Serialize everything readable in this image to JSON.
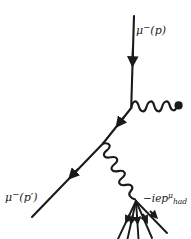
{
  "figure": {
    "type": "feynman-diagram",
    "background_color": "#ffffff",
    "line_color": "#1a1a1a",
    "width": 191,
    "height": 239
  },
  "labels": {
    "incoming_muon": {
      "text": "μ−(p)",
      "mu": "μ",
      "charge": "−",
      "momentum": "(p)"
    },
    "outgoing_muon": {
      "text": "μ−(p′)",
      "mu": "μ",
      "charge": "−",
      "momentum": "(p′)"
    },
    "hadron_current": {
      "text": "−iepμ_had",
      "prefix": "−iep",
      "superscript": "μ",
      "subscript": "had"
    }
  },
  "elements": {
    "incoming_fermion_line": {
      "name": "incoming-muon-line",
      "x1": 134,
      "y1": 18,
      "x2": 131,
      "y2": 108,
      "arrow_at": 0.48,
      "arrow_direction": "down"
    },
    "internal_fermion_line": {
      "name": "internal-muon-line",
      "x1": 131,
      "y1": 108,
      "x2": 103,
      "y2": 143,
      "arrow_at": 0.52,
      "arrow_direction": "down-left"
    },
    "outgoing_fermion_line": {
      "name": "outgoing-muon-line",
      "x1": 103,
      "y1": 143,
      "x2": 33,
      "y2": 216,
      "arrow_at": 0.46,
      "arrow_direction": "down-left"
    },
    "external_photon": {
      "name": "external-photon-wavy-line",
      "x1": 131,
      "y1": 108,
      "x2": 178,
      "y2": 104,
      "waves": 4
    },
    "photon_endpoint_dot": {
      "name": "photon-endpoint-dot",
      "cx": 179,
      "cy": 104,
      "r": 4
    },
    "virtual_photon": {
      "name": "virtual-photon-wavy-line",
      "x1": 103,
      "y1": 143,
      "x2": 136,
      "y2": 201,
      "waves": 4
    },
    "hadron_vertex": {
      "name": "hadron-vertex",
      "cx": 136,
      "cy": 201
    },
    "hadron_jets": {
      "name": "hadron-jet-lines",
      "count": 5,
      "origin_x": 136,
      "origin_y": 201,
      "endpoints": [
        {
          "x": 119,
          "y": 238
        },
        {
          "x": 128,
          "y": 239
        },
        {
          "x": 139,
          "y": 239
        },
        {
          "x": 152,
          "y": 237
        },
        {
          "x": 165,
          "y": 231
        }
      ],
      "arrow_at": 0.62
    }
  }
}
